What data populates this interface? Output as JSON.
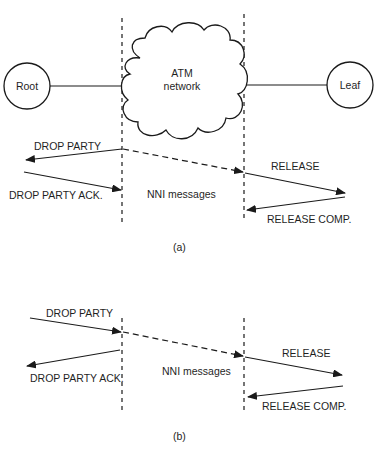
{
  "diagram": {
    "nodes": {
      "root": "Root",
      "leaf": "Leaf",
      "cloud_line1": "ATM",
      "cloud_line2": "network"
    },
    "panel_a": {
      "caption": "(a)",
      "left_messages": [
        "DROP PARTY",
        "DROP PARTY ACK."
      ],
      "middle_label": "NNI messages",
      "right_messages": [
        "RELEASE",
        "RELEASE COMP."
      ]
    },
    "panel_b": {
      "caption": "(b)",
      "left_messages": [
        "DROP PARTY",
        "DROP PARTY ACK."
      ],
      "middle_label": "NNI messages",
      "right_messages": [
        "RELEASE",
        "RELEASE COMP."
      ]
    },
    "colors": {
      "stroke": "#1a1a1a",
      "background": "#ffffff"
    }
  }
}
